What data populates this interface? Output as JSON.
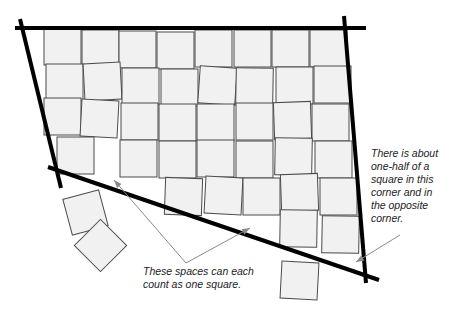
{
  "figure": {
    "width": 464,
    "height": 318,
    "colors": {
      "square_fill": "#f1f1f1",
      "square_stroke": "#4a4a4a",
      "boundary": "#000000",
      "pointer": "#8a8a8a",
      "text": "#222222"
    },
    "square_size": 37,
    "boundary_lines": [
      {
        "name": "top-boundary",
        "x1": 15,
        "y1": 28,
        "x2": 366,
        "y2": 28
      },
      {
        "name": "left-boundary",
        "x1": 20,
        "y1": 19,
        "x2": 61,
        "y2": 188
      },
      {
        "name": "bottom-boundary",
        "x1": 48,
        "y1": 167,
        "x2": 379,
        "y2": 280
      },
      {
        "name": "right-boundary",
        "x1": 344,
        "y1": 16,
        "x2": 366,
        "y2": 283
      }
    ],
    "squares": [
      {
        "x": 44,
        "y": 28,
        "r": 0
      },
      {
        "x": 82,
        "y": 30,
        "r": 0
      },
      {
        "x": 119,
        "y": 31,
        "r": 0
      },
      {
        "x": 157,
        "y": 32,
        "r": 0
      },
      {
        "x": 195,
        "y": 30,
        "r": 0
      },
      {
        "x": 234,
        "y": 30,
        "r": 0
      },
      {
        "x": 272,
        "y": 30,
        "r": 0
      },
      {
        "x": 310,
        "y": 30,
        "r": 0
      },
      {
        "x": 46,
        "y": 64,
        "r": 0
      },
      {
        "x": 84,
        "y": 63,
        "r": -3
      },
      {
        "x": 122,
        "y": 68,
        "r": 0
      },
      {
        "x": 161,
        "y": 69,
        "r": 0
      },
      {
        "x": 199,
        "y": 67,
        "r": 4
      },
      {
        "x": 236,
        "y": 68,
        "r": 1
      },
      {
        "x": 276,
        "y": 67,
        "r": 0
      },
      {
        "x": 314,
        "y": 66,
        "r": 0
      },
      {
        "x": 44,
        "y": 98,
        "r": 0
      },
      {
        "x": 81,
        "y": 100,
        "r": 3
      },
      {
        "x": 121,
        "y": 103,
        "r": 0
      },
      {
        "x": 159,
        "y": 104,
        "r": 0
      },
      {
        "x": 197,
        "y": 104,
        "r": 0
      },
      {
        "x": 236,
        "y": 103,
        "r": 0
      },
      {
        "x": 274,
        "y": 102,
        "r": -2
      },
      {
        "x": 312,
        "y": 104,
        "r": 0
      },
      {
        "x": 57,
        "y": 137,
        "r": 0
      },
      {
        "x": 120,
        "y": 140,
        "r": 0
      },
      {
        "x": 159,
        "y": 141,
        "r": 0
      },
      {
        "x": 197,
        "y": 140,
        "r": 0
      },
      {
        "x": 236,
        "y": 141,
        "r": 0
      },
      {
        "x": 275,
        "y": 138,
        "r": 1
      },
      {
        "x": 315,
        "y": 141,
        "r": 0
      },
      {
        "x": 165,
        "y": 178,
        "r": 2
      },
      {
        "x": 205,
        "y": 177,
        "r": 3
      },
      {
        "x": 243,
        "y": 178,
        "r": 0
      },
      {
        "x": 281,
        "y": 174,
        "r": -2
      },
      {
        "x": 320,
        "y": 178,
        "r": 0
      },
      {
        "x": 280,
        "y": 210,
        "r": 1
      },
      {
        "x": 322,
        "y": 216,
        "r": 1
      },
      {
        "x": 67,
        "y": 194,
        "r": -15
      },
      {
        "x": 82,
        "y": 227,
        "r": 45
      },
      {
        "x": 281,
        "y": 262,
        "r": 3
      }
    ],
    "pointers": [
      {
        "name": "pointer-left-gap",
        "points": "186,263 114,180",
        "head": {
          "x": 114,
          "y": 180,
          "angle": 229
        }
      },
      {
        "name": "pointer-bottom-gap",
        "points": "186,263 250,228",
        "head": {
          "x": 250,
          "y": 228,
          "angle": -29
        }
      },
      {
        "name": "pointer-corner",
        "points": "400,235 356,262",
        "head": {
          "x": 356,
          "y": 262,
          "angle": 149
        }
      }
    ]
  },
  "annotations": {
    "corner_note": {
      "lines": [
        "There is about",
        "one-half of a",
        "square in this",
        "corner and in",
        "the opposite",
        "corner."
      ]
    },
    "spaces_note": {
      "lines": [
        "These spaces can each",
        "count as one square."
      ]
    }
  }
}
